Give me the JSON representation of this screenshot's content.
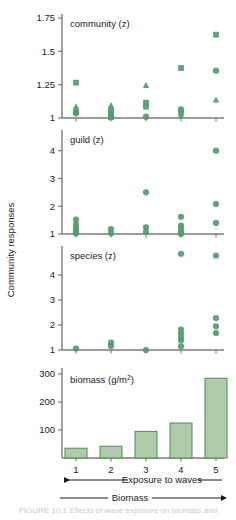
{
  "figure": {
    "y_axis_title": "Community responses",
    "x_arrow_top_label": "Exposure to waves",
    "x_arrow_bottom_label": "Biomass",
    "x_tick_labels": [
      "1",
      "2",
      "3",
      "4",
      "5"
    ],
    "marker_color": "#4F9C6B",
    "bar_fill_color": "#AFCCA8",
    "bar_stroke_color": "#4F8A55",
    "axis_color": "#7a7a7a",
    "caption": "FIGURE 10.1 Effects of wave exposure on biomass and"
  },
  "chart_data": [
    {
      "type": "scatter",
      "title": "community (z)",
      "xlabel": "",
      "ylabel": "",
      "categories": [
        "1",
        "2",
        "3",
        "4",
        "5"
      ],
      "ylim": [
        1,
        1.75
      ],
      "yticks": [
        1,
        1.25,
        1.5,
        1.75
      ],
      "ytick_labels": [
        "1",
        "1.25",
        "1.5",
        "1.75"
      ],
      "grid": false,
      "legend": "none",
      "series": [
        {
          "name": "square",
          "marker": "square",
          "points": [
            {
              "x": 1,
              "y": 1.265
            },
            {
              "x": 1,
              "y": 1.045
            },
            {
              "x": 2,
              "y": 1.055
            },
            {
              "x": 2,
              "y": 1.03
            },
            {
              "x": 2,
              "y": 1.005
            },
            {
              "x": 3,
              "y": 1.115
            },
            {
              "x": 3,
              "y": 1.085
            },
            {
              "x": 4,
              "y": 1.375
            },
            {
              "x": 4,
              "y": 1.04
            },
            {
              "x": 5,
              "y": 1.625
            }
          ]
        },
        {
          "name": "triangle",
          "marker": "triangle",
          "points": [
            {
              "x": 1,
              "y": 1.085
            },
            {
              "x": 2,
              "y": 1.095
            },
            {
              "x": 3,
              "y": 1.245
            },
            {
              "x": 4,
              "y": 1.02
            },
            {
              "x": 5,
              "y": 1.135
            }
          ]
        },
        {
          "name": "circle",
          "marker": "circle",
          "points": [
            {
              "x": 1,
              "y": 1.035
            },
            {
              "x": 2,
              "y": 1.015
            },
            {
              "x": 3,
              "y": 1.01
            },
            {
              "x": 4,
              "y": 1.065
            },
            {
              "x": 5,
              "y": 1.355
            }
          ]
        }
      ]
    },
    {
      "type": "scatter",
      "title": "guild (z)",
      "xlabel": "",
      "ylabel": "",
      "categories": [
        "1",
        "2",
        "3",
        "4",
        "5"
      ],
      "ylim": [
        1,
        4.6
      ],
      "yticks": [
        1,
        2,
        3,
        4
      ],
      "ytick_labels": [
        "1",
        "2",
        "3",
        "4"
      ],
      "grid": false,
      "legend": "none",
      "series": [
        {
          "name": "circle",
          "marker": "circle",
          "points": [
            {
              "x": 1,
              "y": 1.52
            },
            {
              "x": 1,
              "y": 1.35
            },
            {
              "x": 1,
              "y": 1.22
            },
            {
              "x": 1,
              "y": 1.1
            },
            {
              "x": 1,
              "y": 1.02
            },
            {
              "x": 2,
              "y": 1.18
            },
            {
              "x": 2,
              "y": 1.03
            },
            {
              "x": 3,
              "y": 2.5
            },
            {
              "x": 3,
              "y": 1.24
            },
            {
              "x": 3,
              "y": 1.08
            },
            {
              "x": 4,
              "y": 1.62
            },
            {
              "x": 4,
              "y": 1.3
            },
            {
              "x": 4,
              "y": 1.17
            },
            {
              "x": 4,
              "y": 1.06
            },
            {
              "x": 4,
              "y": 1.0
            },
            {
              "x": 5,
              "y": 4.0
            },
            {
              "x": 5,
              "y": 2.08
            },
            {
              "x": 5,
              "y": 1.4
            }
          ]
        }
      ]
    },
    {
      "type": "scatter",
      "title": "species (z)",
      "xlabel": "",
      "ylabel": "",
      "categories": [
        "1",
        "2",
        "3",
        "4",
        "5"
      ],
      "ylim": [
        1,
        5.0
      ],
      "yticks": [
        1,
        2,
        3,
        4
      ],
      "ytick_labels": [
        "1",
        "2",
        "3",
        "4"
      ],
      "grid": false,
      "legend": "none",
      "series": [
        {
          "name": "circle",
          "marker": "circle",
          "points": [
            {
              "x": 1,
              "y": 1.06
            },
            {
              "x": 2,
              "y": 1.3
            },
            {
              "x": 2,
              "y": 1.16
            },
            {
              "x": 3,
              "y": 1.0
            },
            {
              "x": 4,
              "y": 4.85
            },
            {
              "x": 4,
              "y": 1.82
            },
            {
              "x": 4,
              "y": 1.66
            },
            {
              "x": 4,
              "y": 1.5
            },
            {
              "x": 4,
              "y": 1.38
            },
            {
              "x": 4,
              "y": 1.15
            },
            {
              "x": 5,
              "y": 4.78
            },
            {
              "x": 5,
              "y": 2.28
            },
            {
              "x": 5,
              "y": 1.95
            },
            {
              "x": 5,
              "y": 1.68
            }
          ]
        }
      ]
    },
    {
      "type": "bar",
      "title": "biomass (g/m²)",
      "title_base": "biomass (g/m",
      "title_sup": "2",
      "title_close": ")",
      "xlabel": "",
      "ylabel": "",
      "categories": [
        "1",
        "2",
        "3",
        "4",
        "5"
      ],
      "values": [
        35,
        42,
        95,
        125,
        285
      ],
      "ylim": [
        0,
        300
      ],
      "yticks": [
        100,
        200,
        300
      ],
      "ytick_labels": [
        "100",
        "200",
        "300"
      ],
      "grid": false,
      "legend": "none"
    }
  ]
}
